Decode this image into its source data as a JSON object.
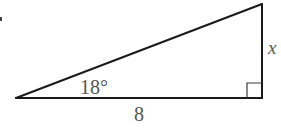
{
  "diagram": {
    "type": "right-triangle",
    "colors": {
      "stroke": "#1a1a1a",
      "label": "#555555",
      "background": "#ffffff"
    },
    "vertices": {
      "left": {
        "x": 16,
        "y": 98
      },
      "right_angle": {
        "x": 262,
        "y": 98
      },
      "top": {
        "x": 262,
        "y": 4
      }
    },
    "labels": {
      "angle": "18°",
      "base": "8",
      "height": "x"
    },
    "right_angle_marker": {
      "size": 15
    }
  }
}
